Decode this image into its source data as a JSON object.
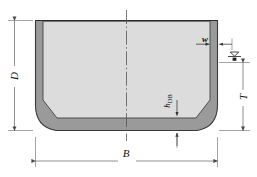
{
  "figure": {
    "type": "engineering-cross-section-drawing",
    "background_color": "#ffffff",
    "shell_color": "#9a9a9a",
    "shell_outline_color": "#3a3a3a",
    "interior_color": "#dcdcdc",
    "dimension_line_color": "#555555",
    "centerline_color": "#555555"
  },
  "labels": {
    "depth": "D",
    "breadth": "B",
    "draft": "T",
    "shell_thickness": "w",
    "double_bottom_height_main": "h",
    "double_bottom_height_sub": "DB"
  },
  "annotations": {
    "waterline_symbol": "waterline-marker",
    "centerline_symbol": "centerline-dash-dot"
  },
  "dimensions": {
    "depth_D": {
      "label": "D",
      "orientation": "vertical",
      "side": "left",
      "measures": "moulded depth from baseline to deck"
    },
    "breadth_B": {
      "label": "B",
      "orientation": "horizontal",
      "side": "bottom",
      "measures": "moulded breadth"
    },
    "draft_T": {
      "label": "T",
      "orientation": "vertical",
      "side": "right",
      "measures": "draft from baseline to waterline"
    },
    "shell_thickness_w": {
      "label": "w",
      "orientation": "horizontal",
      "side": "upper-right",
      "measures": "side shell plating thickness"
    },
    "double_bottom_hDB": {
      "label": "hDB",
      "orientation": "vertical",
      "side": "bottom-center-right",
      "measures": "double bottom height"
    }
  }
}
